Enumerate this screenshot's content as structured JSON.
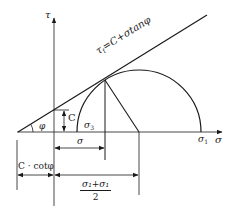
{
  "diagram": {
    "type": "Mohr-Coulomb failure envelope with Mohr circle",
    "axes": {
      "vertical_label": "τ",
      "horizontal_label": "σ"
    },
    "envelope": {
      "equation_prefix": "τ",
      "equation_sub": "f",
      "equation_rest": "=C+σtanφ"
    },
    "labels": {
      "angle": "φ",
      "cohesion": "C",
      "sigma3_symbol": "σ",
      "sigma3_sub": "3",
      "sigma1_symbol": "σ",
      "sigma1_sub": "1",
      "sigma_dim": "σ",
      "c_cot": "C · cotφ",
      "half_sum_numerator": "σ₁+σ₁",
      "half_sum_denominator": "2"
    },
    "colors": {
      "line": "#1a1a1a",
      "axis": "#333333",
      "background": "#ffffff"
    }
  }
}
